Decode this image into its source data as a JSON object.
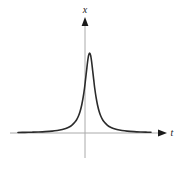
{
  "figure": {
    "background_color": "#ffffff",
    "width": 184,
    "height": 170
  },
  "axes": {
    "vertical": {
      "label": "x",
      "label_name": "x-axis-label",
      "color": "#aaaaaa",
      "arrow_color": "#1a1a1a",
      "x_px": 85,
      "top_px": 22,
      "bottom_px": 158
    },
    "horizontal": {
      "label": "t",
      "label_name": "t-axis-label",
      "color": "#aaaaaa",
      "arrow_color": "#1a1a1a",
      "y_px": 133,
      "left_px": 10,
      "right_px": 162
    }
  },
  "curve": {
    "color": "#2b2b2b",
    "width": 1.6,
    "name": "resonance-curve"
  },
  "chart_data": {
    "type": "line",
    "title": "",
    "xlabel": "t",
    "ylabel": "x",
    "grid": false,
    "legend": null,
    "xlim": [
      -4.2,
      3.6
    ],
    "ylim": [
      0,
      1.05
    ],
    "peak": {
      "x": 0,
      "y": 1.0
    },
    "half_width_at_half_max": 0.34,
    "x": [
      -4.2,
      -3.8,
      -3.4,
      -3.0,
      -2.6,
      -2.2,
      -1.9,
      -1.6,
      -1.4,
      -1.2,
      -1.05,
      -0.9,
      -0.78,
      -0.66,
      -0.56,
      -0.46,
      -0.38,
      -0.3,
      -0.24,
      -0.18,
      -0.12,
      -0.06,
      0.0,
      0.06,
      0.12,
      0.18,
      0.24,
      0.3,
      0.38,
      0.46,
      0.56,
      0.66,
      0.78,
      0.9,
      1.05,
      1.2,
      1.4,
      1.6,
      1.9,
      2.2,
      2.6,
      3.0,
      3.3,
      3.6
    ],
    "y": [
      0.0065,
      0.0079,
      0.0099,
      0.0127,
      0.0168,
      0.0233,
      0.0311,
      0.0435,
      0.0561,
      0.0741,
      0.0946,
      0.1275,
      0.1594,
      0.2088,
      0.2683,
      0.3534,
      0.4443,
      0.5595,
      0.6672,
      0.7778,
      0.8878,
      0.9709,
      1.0,
      0.9709,
      0.8878,
      0.7778,
      0.6672,
      0.5595,
      0.4443,
      0.3534,
      0.2683,
      0.2088,
      0.1594,
      0.1275,
      0.0946,
      0.0741,
      0.0561,
      0.0435,
      0.0311,
      0.0233,
      0.0168,
      0.0127,
      0.0105,
      0.0088
    ]
  }
}
